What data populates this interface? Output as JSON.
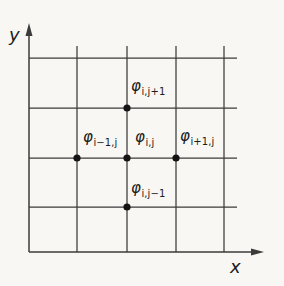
{
  "diagram": {
    "title_semantic": "finite-difference-grid-stencil",
    "colors": {
      "background": "#f8f7f3",
      "line": "#3b3b3b",
      "dot": "#141414",
      "text": "#1c1c1c"
    },
    "axes": {
      "y_label": "y",
      "x_label": "x",
      "y_axis": {
        "x": 29,
        "y_bottom": 252,
        "y_top": 33,
        "arrow_tip_y": 23
      },
      "x_axis": {
        "y": 252,
        "x_left": 29,
        "x_right": 253,
        "arrow_tip_x": 264
      }
    },
    "grid": {
      "vertical_x": [
        77,
        127,
        176,
        224
      ],
      "vertical_y1": 46,
      "vertical_y2": 252,
      "horizontal_y": [
        58,
        108,
        158,
        207
      ],
      "horizontal_x1": 29,
      "horizontal_x2": 237
    },
    "points": [
      {
        "x": 127,
        "y": 108
      },
      {
        "x": 77,
        "y": 158
      },
      {
        "x": 127,
        "y": 158
      },
      {
        "x": 176,
        "y": 158
      },
      {
        "x": 127,
        "y": 207
      }
    ],
    "dot_radius": 3.6,
    "nodes": {
      "top": {
        "phi": "φ",
        "sub": "i,j+1"
      },
      "left": {
        "phi": "φ",
        "sub": "i−1,j"
      },
      "center": {
        "phi": "φ",
        "sub": "i,j"
      },
      "right": {
        "phi": "φ",
        "sub": "i+1,j"
      },
      "bottom": {
        "phi": "φ",
        "sub": "i,j−1"
      }
    }
  }
}
